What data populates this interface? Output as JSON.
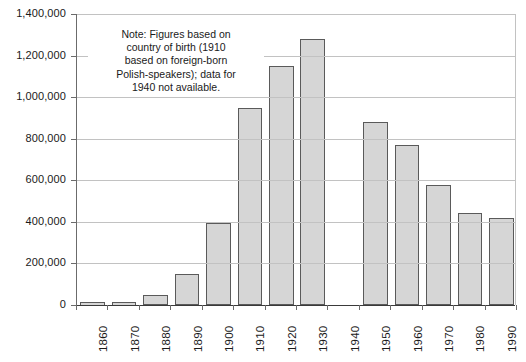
{
  "chart_data": {
    "type": "bar",
    "title": "",
    "xlabel": "",
    "ylabel": "",
    "categories": [
      "1860",
      "1870",
      "1880",
      "1890",
      "1900",
      "1910",
      "1920",
      "1930",
      "1940",
      "1950",
      "1960",
      "1970",
      "1980",
      "1990"
    ],
    "values": [
      8000,
      15000,
      50000,
      150000,
      395000,
      950000,
      1150000,
      1280000,
      null,
      880000,
      770000,
      575000,
      445000,
      420000
    ],
    "ylim": [
      0,
      1400000
    ],
    "y_ticks": [
      0,
      200000,
      400000,
      600000,
      800000,
      1000000,
      1200000,
      1400000
    ],
    "y_tick_labels": [
      "0",
      "200,000",
      "400,000",
      "600,000",
      "800,000",
      "1,000,000",
      "1,200,000",
      "1,400,000"
    ],
    "grid": true,
    "legend": null,
    "missing_categories": [
      "1940"
    ],
    "annotations": [
      {
        "name": "note",
        "lines": [
          "Note: Figures based on",
          "country of birth (1910",
          "based on foreign-born",
          "Polish-speakers); data for",
          "1940 not available."
        ]
      }
    ],
    "colors": {
      "bar_fill": "#d6d6d6",
      "bar_stroke": "#5a5a5a",
      "gridline": "#c2c2c2",
      "axis": "#6b6b6b",
      "baseline": "#3a3a3a",
      "text": "#1a1a1a",
      "background": "#ffffff"
    }
  }
}
